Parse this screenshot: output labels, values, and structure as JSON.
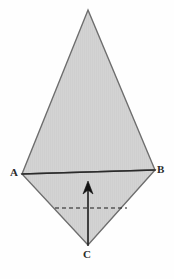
{
  "figure": {
    "background_color": "#fefefe",
    "fill_color": "#d2d2d2",
    "stroke_color": "#6e6e6e",
    "accent_color": "#1a1a1a",
    "labels": {
      "a": "A",
      "b": "B",
      "c": "C"
    },
    "geometry": {
      "apex_top": [
        88,
        10
      ],
      "vertex_a": [
        22,
        174
      ],
      "vertex_b": [
        155,
        170
      ],
      "vertex_c": [
        88,
        245
      ],
      "upper_triangle_points": "88,10 155,170 22,174",
      "lower_triangle_points": "22,174 155,170 88,245",
      "base_line": {
        "x1": 22,
        "y1": 174,
        "x2": 155,
        "y2": 170
      },
      "arrow_shaft": {
        "x1": 88,
        "y1": 245,
        "x2": 88,
        "y2": 188
      },
      "arrow_tip": [
        88,
        182
      ],
      "arrow_head_points": "88,181 83,194 88,190 93,194",
      "dashed_line": {
        "x1": 55,
        "y1": 208,
        "x2": 127,
        "y2": 208
      },
      "dash_pattern": "4 3"
    }
  }
}
